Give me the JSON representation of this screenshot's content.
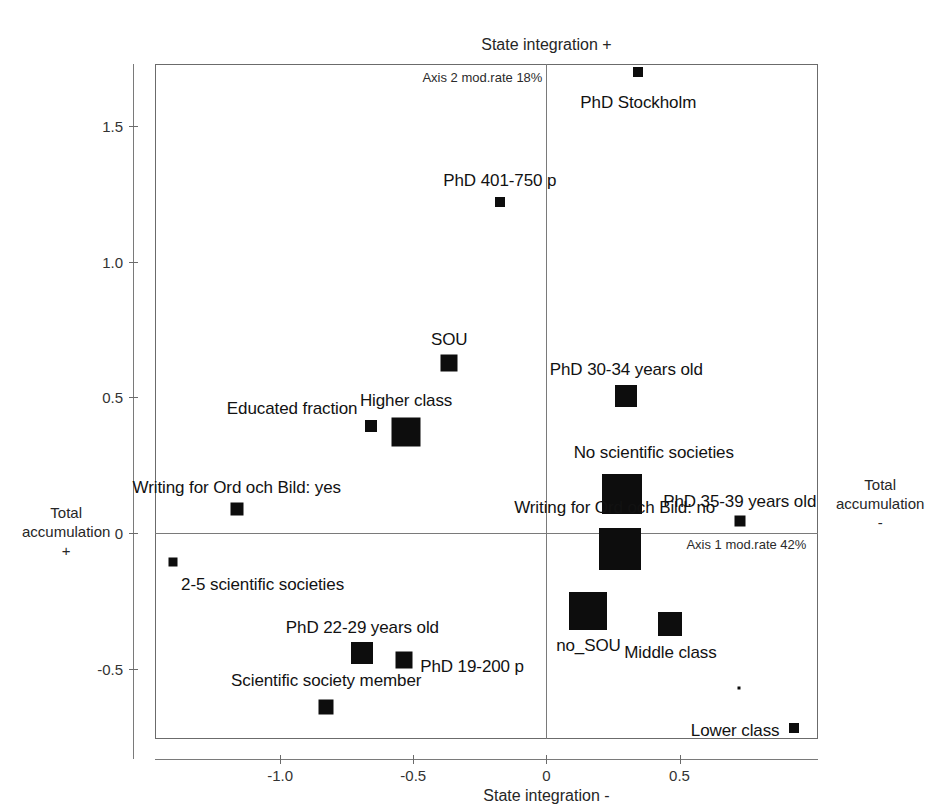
{
  "chart_data": {
    "type": "scatter",
    "title": "",
    "subtitle": "",
    "xlabel_bottom": "State integration -",
    "xlabel_top": "State integration +",
    "ylabel_left": "Total\naccumulation\n+",
    "ylabel_right": "Total\naccumulation\n-",
    "ylabel_left_lines": [
      "Total",
      "accumulation",
      "+"
    ],
    "ylabel_right_lines": [
      "Total",
      "accumulation",
      "-"
    ],
    "axis1_note": "Axis 1 mod.rate 42%",
    "axis2_note": "Axis 2 mod.rate 18%",
    "axis1_modrate_pct": 42,
    "axis2_modrate_pct": 18,
    "xlim": [
      -1.47,
      1.02
    ],
    "ylim": [
      -0.76,
      1.73
    ],
    "xticks": [
      -1.0,
      -0.5,
      0,
      0.5
    ],
    "xticklabels": [
      "-1.0",
      "-0.5",
      "0",
      "0.5"
    ],
    "yticks": [
      -0.5,
      0,
      0.5,
      1.0,
      1.5
    ],
    "yticklabels": [
      "-0.5",
      "0",
      "0.5",
      "1.0",
      "1.5"
    ],
    "grid": false,
    "legend": "none",
    "marker_shape": "square",
    "marker_color": "#0d0d0d",
    "points": [
      {
        "label": "PhD Stockholm",
        "x": 0.345,
        "y": 1.7,
        "size": 10,
        "label_dx": 0,
        "label_dy": 30,
        "anchor": "middle"
      },
      {
        "label": "PhD 401-750 p",
        "x": -0.175,
        "y": 1.222,
        "size": 10,
        "label_dx": 0,
        "label_dy": -22,
        "anchor": "middle"
      },
      {
        "label": "SOU",
        "x": -0.365,
        "y": 0.626,
        "size": 17,
        "label_dx": 0,
        "label_dy": -24,
        "anchor": "middle"
      },
      {
        "label": "Higher class",
        "x": -0.527,
        "y": 0.374,
        "size": 29,
        "label_dx": 0,
        "label_dy": -32,
        "anchor": "middle"
      },
      {
        "label": "Educated fraction",
        "x": -0.657,
        "y": 0.393,
        "size": 12,
        "label_dx": -14,
        "label_dy": -18,
        "anchor": "end"
      },
      {
        "label": "PhD 30-34 years old",
        "x": 0.3,
        "y": 0.504,
        "size": 22,
        "label_dx": 0,
        "label_dy": -27,
        "anchor": "middle"
      },
      {
        "label": "No scientific societies",
        "x": 0.283,
        "y": 0.142,
        "size": 40,
        "label_dx": 32,
        "label_dy": -42,
        "anchor": "middle"
      },
      {
        "label": "Writing for Ord och Bild: no",
        "x": 0.275,
        "y": -0.06,
        "size": 42,
        "label_dx": -5,
        "label_dy": -42,
        "anchor": "middle"
      },
      {
        "label": "PhD 35-39 years old",
        "x": 0.726,
        "y": 0.045,
        "size": 11,
        "label_dx": 0,
        "label_dy": -20,
        "anchor": "middle"
      },
      {
        "label": "Writing for Ord och Bild: yes",
        "x": -1.163,
        "y": 0.089,
        "size": 13,
        "label_dx": 0,
        "label_dy": -22,
        "anchor": "middle"
      },
      {
        "label": "2-5 scientific societies",
        "x": -1.402,
        "y": -0.108,
        "size": 9,
        "label_dx": 8,
        "label_dy": 22,
        "anchor": "start"
      },
      {
        "label": "PhD 22-29 years old",
        "x": -0.691,
        "y": -0.444,
        "size": 22,
        "label_dx": 0,
        "label_dy": -26,
        "anchor": "middle"
      },
      {
        "label": "PhD 19-200 p",
        "x": -0.534,
        "y": -0.467,
        "size": 17,
        "label_dx": 16,
        "label_dy": 6,
        "anchor": "start"
      },
      {
        "label": "Scientific society member",
        "x": -0.827,
        "y": -0.641,
        "size": 15,
        "label_dx": 0,
        "label_dy": -27,
        "anchor": "middle"
      },
      {
        "label": "no_SOU",
        "x": 0.158,
        "y": -0.289,
        "size": 38,
        "label_dx": 0,
        "label_dy": 34,
        "anchor": "middle"
      },
      {
        "label": "Middle class",
        "x": 0.466,
        "y": -0.334,
        "size": 24,
        "label_dx": 0,
        "label_dy": 28,
        "anchor": "middle"
      },
      {
        "label": "Lower class",
        "x": 0.928,
        "y": -0.72,
        "size": 10,
        "label_dx": -14,
        "label_dy": 2,
        "anchor": "end"
      },
      {
        "label": "",
        "x": 0.722,
        "y": -0.572,
        "size": 3,
        "label_dx": 0,
        "label_dy": 0,
        "anchor": "middle"
      }
    ]
  }
}
